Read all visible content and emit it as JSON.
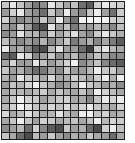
{
  "grid": {
    "columns": 16,
    "rows": 19,
    "border_color": "#1e1e1e",
    "background": "#ffffff",
    "shades": [
      [
        "#c8c8c8",
        "#e6e6e6",
        "#c4c4c4",
        "#a0a0a0",
        "#7a7a7a",
        "#8c8c8c",
        "#e8e8e8",
        "#c8c8c8",
        "#a4a4a4",
        "#c0c0c0",
        "#707070",
        "#5c5c5c",
        "#d0d0d0",
        "#eaeaea",
        "#d8d8d8",
        "#d0d0d0"
      ],
      [
        "#9a9a9a",
        "#cfcfcf",
        "#e8e8e8",
        "#a0a0a0",
        "#8e8e8e",
        "#6e6e6e",
        "#c8c8c8",
        "#9a9a9a",
        "#ebebeb",
        "#9c9c9c",
        "#888888",
        "#c4c4c4",
        "#ececec",
        "#a0a0a0",
        "#707070",
        "#cccccc"
      ],
      [
        "#d0d0d0",
        "#9c9c9c",
        "#888888",
        "#9a9a9a",
        "#8c8c8c",
        "#c8c8c8",
        "#a0a0a0",
        "#ececec",
        "#9a9a9a",
        "#707070",
        "#f2f2f2",
        "#f4f4f4",
        "#f2f2f2",
        "#f0f0f0",
        "#d0d0d0",
        "#cccccc"
      ],
      [
        "#a8a8a8",
        "#8c8c8c",
        "#c8c8c8",
        "#9c9c9c",
        "#5c5c5c",
        "#4c4c4c",
        "#e4e4e4",
        "#9c9c9c",
        "#c4c4c4",
        "#7c7c7c",
        "#a8a8a8",
        "#9c9c9c",
        "#b8b8b8",
        "#a8a8a8",
        "#888888",
        "#c0c0c0"
      ],
      [
        "#8c8c8c",
        "#9c9c9c",
        "#e4e4e4",
        "#b4b4b4",
        "#b4b4b4",
        "#888888",
        "#cccccc",
        "#a4a4a4",
        "#c4c4c4",
        "#e0e0e0",
        "#a4a4a4",
        "#8c8c8c",
        "#cccccc",
        "#e8e8e8",
        "#c8c8c8",
        "#b0b0b0"
      ],
      [
        "#c0c0c0",
        "#a4a4a4",
        "#888888",
        "#9c9c9c",
        "#8a8a8a",
        "#b4b4b4",
        "#888888",
        "#a4a4a4",
        "#c8c8c8",
        "#7c7c7c",
        "#9c9c9c",
        "#b0b0b0",
        "#888888",
        "#a8a8a8",
        "#7c7c7c",
        "#5c5c5c"
      ],
      [
        "#e8e8e8",
        "#9c9c9c",
        "#b0b0b0",
        "#888888",
        "#5a5a5a",
        "#4a4a4a",
        "#b8b8b8",
        "#e0e0e0",
        "#a0a0a0",
        "#9c9c9c",
        "#6c6c6c",
        "#3e3e3e",
        "#cccccc",
        "#e4e4e4",
        "#b8b8b8",
        "#a8a8a8"
      ],
      [
        "#6c6c6c",
        "#5c5c5c",
        "#e8e8e8",
        "#d4d4d4",
        "#888888",
        "#a0a0a0",
        "#c8c8c8",
        "#8c8c8c",
        "#a8a8a8",
        "#bcbcbc",
        "#888888",
        "#9c9c9c",
        "#c4c4c4",
        "#b0b0b0",
        "#888888",
        "#8c8c8c"
      ],
      [
        "#a4a4a4",
        "#d4d4d4",
        "#9c9c9c",
        "#a0a0a0",
        "#e8e8e8",
        "#c0c0c0",
        "#9c9c9c",
        "#b4b4b4",
        "#d4d4d4",
        "#f0f0f0",
        "#8c8c8c",
        "#a4a4a4",
        "#c4c4c4",
        "#888888",
        "#6c6c6c",
        "#5c5c5c"
      ],
      [
        "#c4c4c4",
        "#a0a0a0",
        "#b0b0b0",
        "#8c8c8c",
        "#6c6c6c",
        "#7a7a7a",
        "#a8a8a8",
        "#8c8c8c",
        "#cccccc",
        "#a0a0a0",
        "#9c9c9c",
        "#b8b8b8",
        "#ececec",
        "#c8c8c8",
        "#cccccc",
        "#a0a0a0"
      ],
      [
        "#b4b4b4",
        "#9c9c9c",
        "#e8e8e8",
        "#c8c8c8",
        "#c0c0c0",
        "#a8a8a8",
        "#d8d8d8",
        "#a8a8a8",
        "#b0b0b0",
        "#d0d0d0",
        "#bcbcbc",
        "#a8a8a8",
        "#d0d0d0",
        "#ececec",
        "#b0b0b0",
        "#eeeeee"
      ],
      [
        "#9c9c9c",
        "#c4c4c4",
        "#b4b4b4",
        "#d4d4d4",
        "#f0f0f0",
        "#c8c8c8",
        "#b0b0b0",
        "#8c8c8c",
        "#a0a0a0",
        "#bcbcbc",
        "#ececec",
        "#c8c8c8",
        "#b8b8b8",
        "#a0a0a0",
        "#b0b0b0",
        "#8c8c8c"
      ],
      [
        "#a8a8a8",
        "#bcbcbc",
        "#b8b8b8",
        "#a8a8a8",
        "#bcbcbc",
        "#cccccc",
        "#a8a8a8",
        "#c4c4c4",
        "#b0b0b0",
        "#a8a8a8",
        "#c4c4c4",
        "#a0a0a0",
        "#eeeeee",
        "#d0d0d0",
        "#bcbcbc",
        "#a8a8a8"
      ],
      [
        "#a8a8a8",
        "#c8c8c8",
        "#f0f0f0",
        "#d0d0d0",
        "#c8c8c8",
        "#a0a0a0",
        "#b8b8b8",
        "#c8c8c8",
        "#d0d0d0",
        "#a8a8a8",
        "#a8a8a8",
        "#888888",
        "#c4c4c4",
        "#e8e8e8",
        "#d4d4d4",
        "#ececec"
      ],
      [
        "#b8b8b8",
        "#d0d0d0",
        "#f2f2f2",
        "#e0e0e0",
        "#c4c4c4",
        "#bcbcbc",
        "#d8d8d8",
        "#c0c0c0",
        "#dcdcdc",
        "#c0c0c0",
        "#d4d4d4",
        "#ececec",
        "#c8c8c8",
        "#bcbcbc",
        "#a8a8a8",
        "#d4d4d4"
      ],
      [
        "#d8d8d8",
        "#a8a8a8",
        "#bcbcbc",
        "#e0e0e0",
        "#c8c8c8",
        "#a8a8a8",
        "#b4b4b4",
        "#e4e4e4",
        "#bcbcbc",
        "#a8a8a8",
        "#ececec",
        "#f0f0f0",
        "#c4c4c4",
        "#d4d4d4",
        "#a8a8a8",
        "#b4b4b4"
      ],
      [
        "#a8a8a8",
        "#c4c4c4",
        "#ececec",
        "#c4c4c4",
        "#a0a0a0",
        "#d0d0d0",
        "#c8c8c8",
        "#a8a8a8",
        "#bcbcbc",
        "#c4c4c4",
        "#a8a8a8",
        "#c0c0c0",
        "#ececec",
        "#b8b8b8",
        "#d4d4d4",
        "#cccccc"
      ],
      [
        "#8c8c8c",
        "#a0a0a0",
        "#b8b8b8",
        "#6c6c6c",
        "#d0d0d0",
        "#888888",
        "#5c5c5c",
        "#4c4c4c",
        "#c8c8c8",
        "#a0a0a0",
        "#b0b0b0",
        "#6c6c6c",
        "#4a4a4a",
        "#d0d0d0",
        "#ececec",
        "#c0c0c0"
      ],
      [
        "#c4c4c4",
        "#a8a8a8",
        "#6c6c6c",
        "#4c4c4c",
        "#bcbcbc",
        "#9c9c9c",
        "#c8c8c8",
        "#a0a0a0",
        "#8c8c8c",
        "#b0b0b0",
        "#a0a0a0",
        "#c8c8c8",
        "#a8a8a8",
        "#9c9c9c",
        "#6c6c6c",
        "#a8a8a8"
      ]
    ]
  }
}
